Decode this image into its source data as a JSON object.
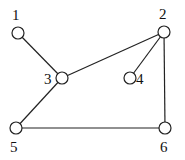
{
  "graph": {
    "nodes": [
      {
        "id": "1",
        "label": "1",
        "x": 18,
        "y": 33,
        "lx": 12,
        "ly": 20
      },
      {
        "id": "2",
        "label": "2",
        "x": 164,
        "y": 32,
        "lx": 159,
        "ly": 19
      },
      {
        "id": "3",
        "label": "3",
        "x": 62,
        "y": 78,
        "lx": 44,
        "ly": 84
      },
      {
        "id": "4",
        "label": "4",
        "x": 130,
        "y": 78,
        "lx": 136,
        "ly": 84
      },
      {
        "id": "5",
        "label": "5",
        "x": 16,
        "y": 128,
        "lx": 10,
        "ly": 152
      },
      {
        "id": "6",
        "label": "6",
        "x": 165,
        "y": 128,
        "lx": 160,
        "ly": 152
      }
    ],
    "edges": [
      [
        "1",
        "3"
      ],
      [
        "3",
        "2"
      ],
      [
        "2",
        "4"
      ],
      [
        "2",
        "6"
      ],
      [
        "3",
        "5"
      ],
      [
        "5",
        "6"
      ]
    ],
    "node_radius": 6
  }
}
